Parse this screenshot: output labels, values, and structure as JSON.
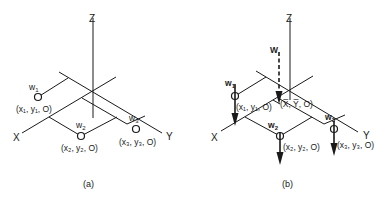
{
  "panel_a": {
    "caption": "(a)",
    "axes": {
      "z": "Z",
      "x": "X",
      "y": "Y"
    },
    "points": [
      {
        "weight": "w",
        "weight_sub": "1",
        "coord": "(x₁, y₁, O)"
      },
      {
        "weight": "w",
        "weight_sub": "2",
        "coord": "(x₂, y₂, O)"
      },
      {
        "weight": "w",
        "weight_sub": "3",
        "coord": "(x₃, y₃, O)"
      }
    ]
  },
  "panel_b": {
    "caption": "(b)",
    "axes": {
      "z": "Z",
      "x": "X",
      "y": "Y"
    },
    "resultant": {
      "label": "W",
      "coord": "(X̅, Y̅, O)"
    },
    "points": [
      {
        "weight": "w",
        "weight_sub": "1",
        "coord": "(x₁, y₁, O)"
      },
      {
        "weight": "w",
        "weight_sub": "2",
        "coord": "(x₂, y₂, O)"
      },
      {
        "weight": "w",
        "weight_sub": "3",
        "coord": "(x₃, y₃, O)"
      }
    ]
  }
}
